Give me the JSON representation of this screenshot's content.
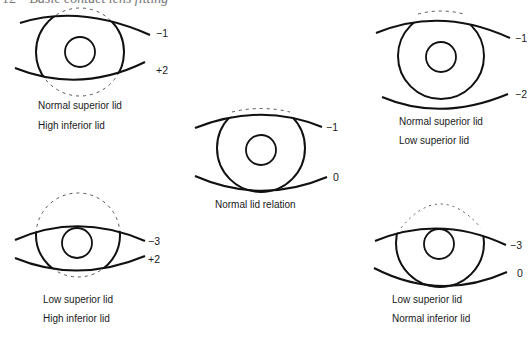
{
  "header": {
    "page_number": "12",
    "title": "Basic contact lens fitting"
  },
  "panels": [
    {
      "id": "normal-superior-high-inferior",
      "caption": [
        "Normal superior lid",
        "High inferior lid"
      ],
      "upper_value": "−1",
      "lower_value": "+2"
    },
    {
      "id": "normal-lid-relation",
      "caption": [
        "Normal lid relation"
      ],
      "upper_value": "−1",
      "lower_value": "0"
    },
    {
      "id": "normal-superior-low-superior",
      "caption": [
        "Normal superior lid",
        "Low superior lid"
      ],
      "upper_value": "−1",
      "lower_value": "−2"
    },
    {
      "id": "low-superior-high-inferior",
      "caption": [
        "Low superior lid",
        "High inferior lid"
      ],
      "upper_value": "−3",
      "lower_value": "+2"
    },
    {
      "id": "low-superior-normal-inferior",
      "caption": [
        "Low superior lid",
        "Normal inferior lid"
      ],
      "upper_value": "−3",
      "lower_value": "0"
    }
  ],
  "colors": {
    "line": "#111111",
    "dashed": "#555555",
    "text": "#1a1a1a"
  }
}
